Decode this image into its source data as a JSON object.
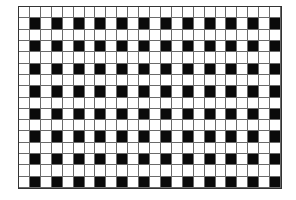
{
  "figure": {
    "type": "checkered-grid-pattern",
    "columns": 24,
    "rows": 16,
    "pattern_rule": "cell is filled when row index and column index are both odd (0-based)",
    "colors": {
      "filled": "#0a0a0a",
      "empty": "#ffffff",
      "gridline": "#6a6a6a",
      "background": "#ffffff"
    }
  }
}
